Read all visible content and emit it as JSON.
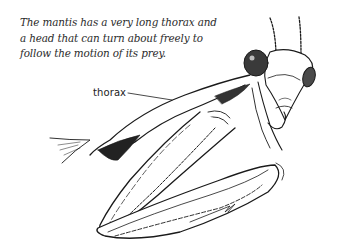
{
  "figure": {
    "caption_lines": [
      "The mantis has a very long thorax and",
      "a head that can turn about freely to",
      "follow the motion of its prey."
    ],
    "labels": [
      {
        "text": "thorax",
        "points_to": "thorax"
      }
    ],
    "colors": {
      "ink": "#1a1a1a",
      "background": "#ffffff"
    }
  }
}
